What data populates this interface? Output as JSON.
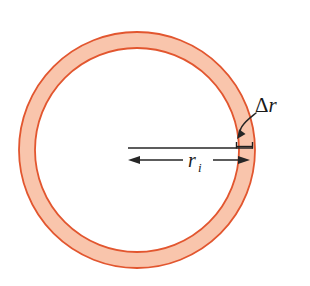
{
  "figure": {
    "background_color": "#ffffff",
    "width": 310,
    "height": 286,
    "annulus": {
      "name": "ring",
      "center_x": 137,
      "center_y": 150,
      "outer_radius": 118,
      "inner_radius": 102,
      "band_thickness": 16,
      "fill_color": "#f9c5ac",
      "stroke_color": "#e2562f",
      "stroke_width": 1.8
    },
    "labels": {
      "delta_r": {
        "name": "delta-r-label",
        "delta_symbol": "Δ",
        "radius_symbol": "r",
        "text": "Δr",
        "x": 255,
        "y": 112,
        "color": "#1a1a1a"
      },
      "inner_radius": {
        "name": "inner-radius-label",
        "radius_symbol": "r",
        "subscript": "i",
        "text": "rᵢ",
        "x": 188,
        "y": 167,
        "color": "#1a1a1a"
      }
    },
    "dimension_lines": {
      "reference_line": {
        "name": "reference-line",
        "x1": 128,
        "y1": 148,
        "x2": 253,
        "y2": 148
      },
      "radius_arrow": {
        "name": "inner-radius-dimension-arrow",
        "x1": 128,
        "y1": 160,
        "x2": 250,
        "y2": 160,
        "arrow_left": true,
        "arrow_right": true,
        "gap_start": 183,
        "gap_end": 213
      },
      "thickness_bracket": {
        "name": "thickness-bracket",
        "x1": 236,
        "x2": 253,
        "y": 147,
        "tick_height": 5
      },
      "leader_arrow": {
        "name": "delta-r-leader-arrow",
        "start_x": 256,
        "start_y": 113,
        "end_x": 237,
        "end_y": 139
      }
    },
    "colors": {
      "band_fill": "#f9c5ac",
      "band_stroke": "#e2562f",
      "ink": "#262626",
      "background": "#ffffff"
    }
  }
}
